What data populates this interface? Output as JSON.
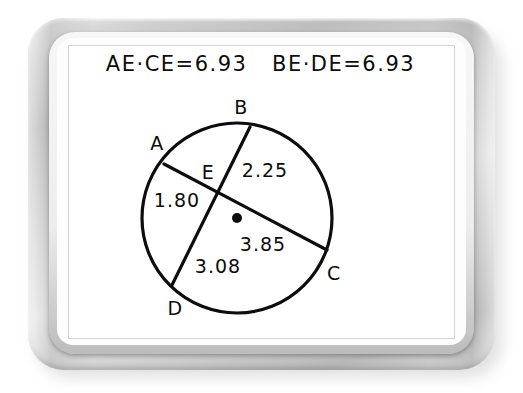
{
  "board": {
    "equations_line": "AE·CE=6.93   BE·DE=6.93",
    "equation_left": "AE·CE=6.93",
    "equation_right": "BE·DE=6.93"
  },
  "diagram": {
    "type": "circle-with-intersecting-chords",
    "circle": {
      "cx": 237,
      "cy": 218,
      "r": 95
    },
    "center_dot": {
      "cx": 237,
      "cy": 218,
      "r": 5
    },
    "intersection": {
      "label": "E",
      "x": 217,
      "y": 195
    },
    "points": [
      {
        "label": "A",
        "x": 164,
        "y": 164,
        "label_x": 157,
        "label_y": 143
      },
      {
        "label": "B",
        "x": 250,
        "y": 127,
        "label_x": 241,
        "label_y": 107
      },
      {
        "label": "C",
        "x": 327,
        "y": 250,
        "label_x": 334,
        "label_y": 273
      },
      {
        "label": "D",
        "x": 172,
        "y": 285,
        "label_x": 175,
        "label_y": 308
      },
      {
        "label": "E",
        "x": 217,
        "y": 195,
        "label_x": 208,
        "label_y": 172
      }
    ],
    "chords": [
      {
        "name": "AC",
        "from": "A",
        "to": "C",
        "x1": 164,
        "y1": 164,
        "x2": 327,
        "y2": 250
      },
      {
        "name": "BD",
        "from": "B",
        "to": "D",
        "x1": 250,
        "y1": 127,
        "x2": 172,
        "y2": 285
      }
    ],
    "segments": [
      {
        "name": "AE",
        "value": "1.80",
        "x": 177,
        "y": 200
      },
      {
        "name": "BE",
        "value": "2.25",
        "x": 265,
        "y": 170
      },
      {
        "name": "EC",
        "value": "3.85",
        "x": 263,
        "y": 244
      },
      {
        "name": "ED",
        "value": "3.08",
        "x": 218,
        "y": 266
      }
    ],
    "colors": {
      "ink": "#0d0d0d",
      "board": "#ffffff"
    }
  }
}
